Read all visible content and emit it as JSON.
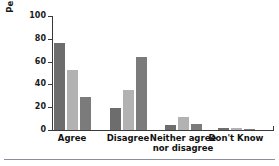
{
  "chart_data": {
    "type": "bar",
    "title": "",
    "subtitle": "",
    "xlabel": "",
    "ylabel": "Percentage",
    "ylim": [
      0,
      100
    ],
    "yticks": [
      0,
      20,
      40,
      60,
      80,
      100
    ],
    "ytick_labels": [
      "0",
      "20",
      "40",
      "60",
      "80",
      "100"
    ],
    "grid": false,
    "legend": false,
    "legend_position": "none",
    "categories": [
      "Agree",
      "Disagree",
      "Neither agree\nnor disagree",
      "Don't Know"
    ],
    "series": [
      {
        "name": "Series 1",
        "color": "#6d6d6d",
        "values": [
          76,
          19,
          4,
          2
        ]
      },
      {
        "name": "Series 2",
        "color": "#b2b2b2",
        "values": [
          53,
          35,
          11,
          2
        ]
      },
      {
        "name": "Series 3",
        "color": "#7b7b7b",
        "values": [
          29,
          64,
          5,
          1
        ]
      }
    ],
    "annotations": []
  },
  "figure": {
    "background": "#ffffff",
    "axis_color": "#3a3a3a",
    "text_color": "#111111",
    "rule_color": "#8a8fa0"
  }
}
